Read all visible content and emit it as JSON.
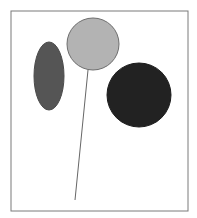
{
  "canvas": {
    "width": 197,
    "height": 218,
    "background": "#ffffff"
  },
  "frame": {
    "x": 11,
    "y": 11,
    "width": 177,
    "height": 200,
    "stroke": "#7a7a7a"
  },
  "shapes": {
    "ellipse": {
      "cx": 49,
      "cy": 76,
      "rx": 15,
      "ry": 34,
      "fill": "#555555",
      "stroke": "#4a4a4a"
    },
    "balloon": {
      "cx": 93,
      "cy": 44,
      "r": 26,
      "fill": "#b3b3b3",
      "stroke": "#6e6e6e"
    },
    "string": {
      "x1": 88,
      "y1": 70,
      "x2": 75,
      "y2": 200,
      "stroke": "#666666"
    },
    "dark_circle": {
      "cx": 139,
      "cy": 95,
      "r": 32,
      "fill": "#222222",
      "stroke": "#1c1c1c"
    }
  }
}
